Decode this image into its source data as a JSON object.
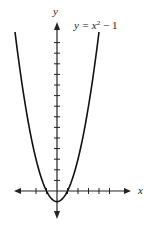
{
  "chart_data": {
    "type": "line",
    "title": "",
    "equation_label": "y = x² − 1",
    "xlabel": "x",
    "ylabel": "y",
    "xlim": [
      -4,
      6
    ],
    "ylim": [
      -2,
      15
    ],
    "x_ticks": [
      -2,
      -1,
      1,
      2,
      3,
      4,
      5
    ],
    "y_ticks": [
      1,
      2,
      3,
      4,
      5,
      6,
      7,
      8,
      9,
      10,
      11,
      12,
      13,
      14
    ],
    "grid": false,
    "series": [
      {
        "name": "y = x^2 - 1",
        "x": [
          -4,
          -3,
          -2,
          -1,
          0,
          1,
          2,
          3,
          4
        ],
        "y": [
          15,
          8,
          3,
          0,
          -1,
          0,
          3,
          8,
          15
        ]
      }
    ]
  },
  "colors": {
    "axis": "#222222",
    "curve": "#111111"
  }
}
